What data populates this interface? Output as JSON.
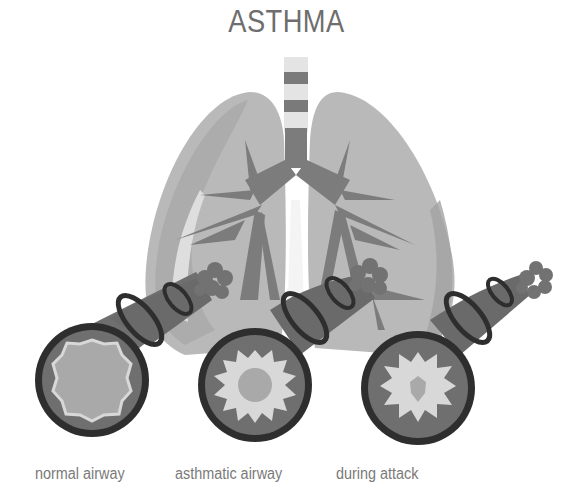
{
  "title": "ASTHMA",
  "labels": [
    {
      "id": "normal",
      "text": "normal airway"
    },
    {
      "id": "asthmatic",
      "text": "asthmatic airway"
    },
    {
      "id": "attack",
      "text": "during attack"
    }
  ],
  "colors": {
    "lung": "#b9b9b9",
    "lung_shade": "#a4a4a4",
    "lung_highlight": "#e2e2e2",
    "bronchi": "#7c7c7c",
    "tube": "#6f6f6f",
    "tube_ring": "#2e2e2e",
    "lumen_border": "#d8d8d8",
    "lumen": "#a9a9a9",
    "alveoli": "#727272",
    "title_text": "#6e6e6e",
    "label_text": "#7a7a7a"
  }
}
